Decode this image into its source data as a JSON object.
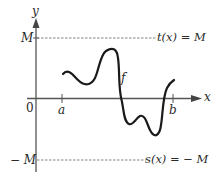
{
  "diagram": {
    "axes": {
      "x_label": "x",
      "y_label": "y",
      "origin_label": "0"
    },
    "ticks": {
      "a_label": "a",
      "b_label": "b"
    },
    "bounds": {
      "upper_left_label": "M",
      "upper_line_label": "t(x) = M",
      "lower_left_label": "− M",
      "lower_line_label": "s(x) = − M"
    },
    "curve": {
      "label": "f",
      "color": "#1a1a1a"
    },
    "colors": {
      "axis": "#555555",
      "dashed": "#777777",
      "text": "#2a2a2a"
    }
  }
}
